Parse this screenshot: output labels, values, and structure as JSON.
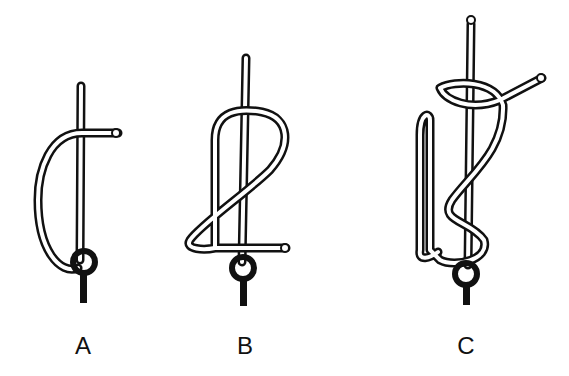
{
  "diagram": {
    "type": "knot-tying-steps",
    "steps": [
      {
        "label": "A",
        "x": 83
      },
      {
        "label": "B",
        "x": 245
      },
      {
        "label": "C",
        "x": 466
      }
    ],
    "colors": {
      "rope_outline": "#111111",
      "rope_fill": "#ffffff",
      "ring": "#111111"
    }
  }
}
